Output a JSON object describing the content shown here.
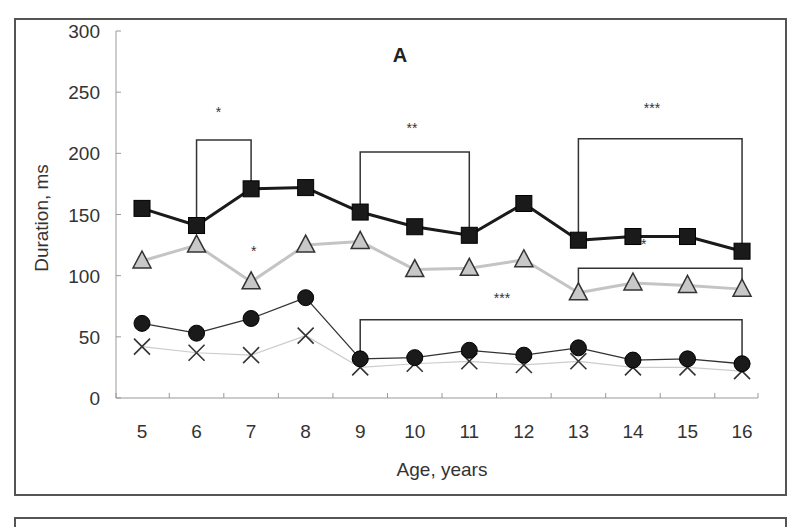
{
  "chart_data": {
    "type": "line",
    "panel_label": "A",
    "title": "",
    "xlabel": "Age, years",
    "ylabel": "Duration, ms",
    "ylim": [
      0,
      300
    ],
    "yticks": [
      0,
      50,
      100,
      150,
      200,
      250,
      300
    ],
    "grid": false,
    "legend": null,
    "categories": [
      "5",
      "6",
      "7",
      "8",
      "9",
      "10",
      "11",
      "12",
      "13",
      "14",
      "15",
      "16"
    ],
    "x": [
      5,
      6,
      7,
      8,
      9,
      10,
      11,
      12,
      13,
      14,
      15,
      16
    ],
    "series": [
      {
        "name": "squares",
        "marker": "square",
        "line_color": "#1a1a1a",
        "marker_fill": "#1a1a1a",
        "line_width": 3,
        "values": [
          155,
          141,
          171,
          172,
          152,
          140,
          133,
          159,
          129,
          132,
          132,
          120
        ]
      },
      {
        "name": "triangles",
        "marker": "triangle",
        "line_color": "#c4c4c4",
        "marker_fill": "#c8c8c8",
        "line_width": 3,
        "values": [
          112,
          125,
          95,
          125,
          128,
          105,
          106,
          113,
          86,
          94,
          92,
          89
        ]
      },
      {
        "name": "circles",
        "marker": "circle",
        "line_color": "#333333",
        "marker_fill": "#1a1a1a",
        "line_width": 1.3,
        "values": [
          61,
          53,
          65,
          82,
          32,
          33,
          39,
          35,
          41,
          31,
          32,
          28
        ]
      },
      {
        "name": "crosses",
        "marker": "x",
        "line_color": "#cccccc",
        "marker_fill": "#333333",
        "line_width": 1.2,
        "values": [
          42,
          37,
          35,
          51,
          25,
          28,
          30,
          27,
          30,
          25,
          25,
          22
        ]
      }
    ],
    "annotations": [
      {
        "type": "bracket",
        "from_x": 6,
        "to_x": 7,
        "y": 211,
        "left_bottom": 141,
        "right_bottom": 171,
        "label": "*",
        "label_x": 6.4,
        "label_y": 230
      },
      {
        "type": "bracket",
        "from_x": 9,
        "to_x": 11,
        "y": 201,
        "left_bottom": 152,
        "right_bottom": 133,
        "label": "**",
        "label_x": 9.95,
        "label_y": 217
      },
      {
        "type": "bracket",
        "from_x": 13,
        "to_x": 16,
        "y": 212,
        "left_bottom": 129,
        "right_bottom": 120,
        "label": "***",
        "label_x": 14.35,
        "label_y": 233
      },
      {
        "type": "bracket",
        "from_x": 13,
        "to_x": 16,
        "y": 106,
        "left_bottom": 86,
        "right_bottom": 89,
        "label": "***",
        "label_x": 14.1,
        "label_y": 122
      },
      {
        "type": "bracket",
        "from_x": 9,
        "to_x": 16,
        "y": 64,
        "left_bottom": 32,
        "right_bottom": 28,
        "label": "***",
        "label_x": 11.6,
        "label_y": 78
      },
      {
        "type": "text",
        "label": "*",
        "x": 7.05,
        "y": 116
      }
    ]
  }
}
